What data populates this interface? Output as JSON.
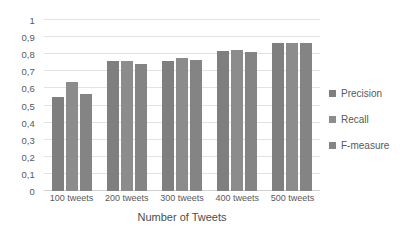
{
  "chart_data": {
    "type": "bar",
    "title": "",
    "xlabel": "Number of Tweets",
    "ylabel": "",
    "categories": [
      "100 tweets",
      "200 tweets",
      "300 tweets",
      "400 tweets",
      "500 tweets"
    ],
    "series": [
      {
        "name": "Precision",
        "values": [
          0.55,
          0.76,
          0.76,
          0.82,
          0.865
        ],
        "color": "#7f7f7f"
      },
      {
        "name": "Recall",
        "values": [
          0.64,
          0.76,
          0.78,
          0.825,
          0.865
        ],
        "color": "#8c8c8c"
      },
      {
        "name": "F-measure",
        "values": [
          0.57,
          0.745,
          0.765,
          0.815,
          0.865
        ],
        "color": "#848484"
      }
    ],
    "ylim": [
      0,
      1
    ],
    "ytick_labels": [
      "0",
      "0,1",
      "0,2",
      "0,3",
      "0,4",
      "0,5",
      "0,6",
      "0,7",
      "0,8",
      "0,9",
      "1"
    ],
    "ytick_values": [
      0,
      0.1,
      0.2,
      0.3,
      0.4,
      0.5,
      0.6,
      0.7,
      0.8,
      0.9,
      1
    ],
    "grid": true,
    "legend_position": "right",
    "gridline_color": "#e2e2e2",
    "text_color": "#595959"
  }
}
